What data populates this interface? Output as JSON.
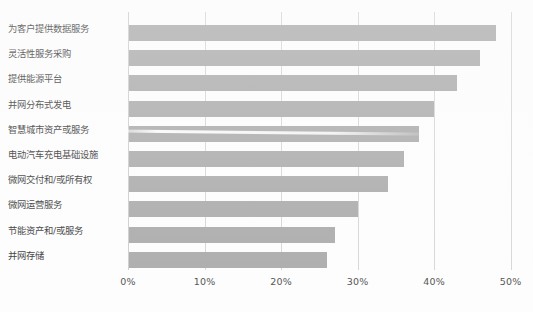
{
  "chart_data": {
    "type": "bar",
    "orientation": "horizontal",
    "title": "",
    "xlabel": "",
    "ylabel": "",
    "xlim": [
      0,
      50
    ],
    "xticks": [
      "0%",
      "10%",
      "20%",
      "30%",
      "40%",
      "50%"
    ],
    "xtick_values": [
      0,
      10,
      20,
      30,
      40,
      50
    ],
    "grid": true,
    "legend": "none",
    "bar_color": "#a3a3a3",
    "value_suffix": "%",
    "categories": [
      "为客户提供数据服务",
      "灵活性服务采购",
      "提供能源平台",
      "并网分布式发电",
      "智慧城市资产或服务",
      "电动汽车充电基础设施",
      "微网交付和/或所有权",
      "微网运营服务",
      "节能资产和/或服务",
      "并网存储"
    ],
    "values": [
      48,
      46,
      43,
      40,
      38,
      36,
      34,
      30,
      27,
      26
    ]
  }
}
